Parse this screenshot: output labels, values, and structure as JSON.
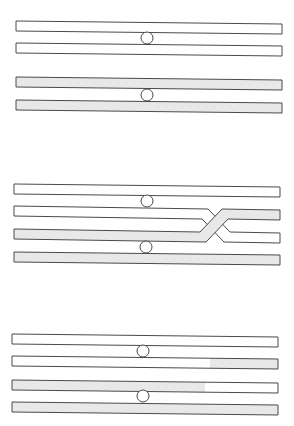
{
  "diagram": {
    "type": "crossing-over-stages",
    "colors": {
      "background": "#ffffff",
      "outline": "#4a4a4a",
      "chromatid_white": "#ffffff",
      "chromatid_gray": "#e8e8e8"
    },
    "stages": [
      {
        "name": "stage-1-homologous-pairs",
        "chromosomes": [
          {
            "label": "white-homolog",
            "centromere": [
              147,
              38
            ],
            "chromatids": [
              {
                "x1": 16,
                "y1": 21,
                "x2": 282,
                "y2": 24,
                "h": 10,
                "color": "white"
              },
              {
                "x1": 16,
                "y1": 43,
                "x2": 282,
                "y2": 46,
                "h": 10,
                "color": "white"
              }
            ]
          },
          {
            "label": "gray-homolog",
            "centromere": [
              147,
              95
            ],
            "chromatids": [
              {
                "x1": 16,
                "y1": 77,
                "x2": 282,
                "y2": 80,
                "h": 10,
                "color": "gray"
              },
              {
                "x1": 16,
                "y1": 100,
                "x2": 282,
                "y2": 103,
                "h": 10,
                "color": "gray"
              }
            ]
          }
        ]
      },
      {
        "name": "stage-2-synapsis-crossing-over",
        "centromeres": [
          [
            147,
            201
          ],
          [
            146,
            247
          ]
        ],
        "chromatids": [
          {
            "x1": 14,
            "y1": 184,
            "x2": 280,
            "y2": 187,
            "h": 10,
            "color": "white"
          },
          {
            "x1": 14,
            "y1": 252,
            "x2": 280,
            "y2": 255,
            "h": 10,
            "color": "gray"
          }
        ],
        "crossover": {
          "point_x": 218,
          "upper_y": 207,
          "lower_y": 230
        }
      },
      {
        "name": "stage-3-recombinant-chromatids",
        "chromosomes": [
          {
            "label": "white-homolog",
            "centromere": [
              143,
              351
            ],
            "chromatids": [
              {
                "x1": 12,
                "y1": 334,
                "x2": 278,
                "y2": 337,
                "h": 10,
                "segments": [
                  {
                    "from": 12,
                    "to": 278,
                    "color": "white"
                  }
                ]
              },
              {
                "x1": 12,
                "y1": 356,
                "x2": 278,
                "y2": 359,
                "h": 10,
                "segments": [
                  {
                    "from": 12,
                    "to": 210,
                    "color": "white"
                  },
                  {
                    "from": 210,
                    "to": 278,
                    "color": "gray"
                  }
                ]
              }
            ]
          },
          {
            "label": "gray-homolog",
            "centromere": [
              143,
              396
            ],
            "chromatids": [
              {
                "x1": 12,
                "y1": 380,
                "x2": 278,
                "y2": 383,
                "h": 10,
                "segments": [
                  {
                    "from": 12,
                    "to": 205,
                    "color": "gray"
                  },
                  {
                    "from": 205,
                    "to": 278,
                    "color": "white"
                  }
                ]
              },
              {
                "x1": 12,
                "y1": 402,
                "x2": 278,
                "y2": 405,
                "h": 10,
                "segments": [
                  {
                    "from": 12,
                    "to": 278,
                    "color": "gray"
                  }
                ]
              }
            ]
          }
        ]
      }
    ]
  }
}
